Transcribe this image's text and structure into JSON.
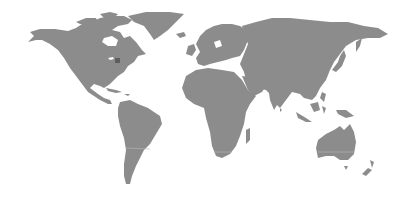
{
  "map": {
    "type": "world-choropleth",
    "background_color": "#ffffff",
    "land_color": "#8c8c8c",
    "highlight_color": "#5e5e5e",
    "highlighted_regions": [
      {
        "name": "Ohio (United States)",
        "approx_x": 117,
        "approx_y": 60
      }
    ],
    "continents": [
      "North America",
      "South America",
      "Europe",
      "Africa",
      "Asia",
      "Australia",
      "Greenland",
      "New Zealand"
    ]
  }
}
